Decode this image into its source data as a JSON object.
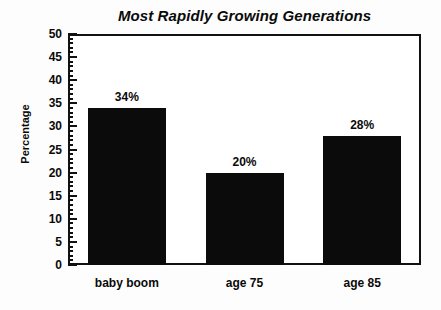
{
  "chart_data": {
    "type": "bar",
    "title": "Most Rapidly Growing Generations",
    "xlabel": "",
    "ylabel": "Percentage",
    "categories": [
      "baby boom",
      "age 75",
      "age 85"
    ],
    "values": [
      34,
      20,
      28
    ],
    "data_labels": [
      "34%",
      "20%",
      "28%"
    ],
    "ylim": [
      0,
      50
    ],
    "ytick_step": 5,
    "yminor_step": 1,
    "ytick_labels": [
      "0",
      "5",
      "10",
      "15",
      "20",
      "25",
      "30",
      "35",
      "40",
      "45",
      "50"
    ],
    "grid": false,
    "legend": null,
    "bar_color": "#0b0b0b",
    "frame_color": "#111111",
    "background_color": "#ffffff"
  },
  "colors": {
    "bar": "#0b0b0b",
    "axis": "#111111",
    "text": "#0a0a0a",
    "page_background": "#fdfdfd"
  }
}
